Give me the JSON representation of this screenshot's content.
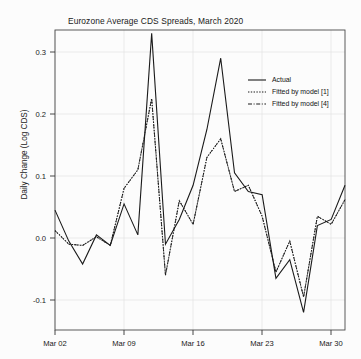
{
  "chart_data": {
    "type": "line",
    "title": "Eurozone Average CDS Spreads, March 2020",
    "xlabel": "",
    "ylabel": "Daily Change (Log CDS)",
    "ylim": [
      -0.16,
      0.345
    ],
    "xlim": [
      0,
      21
    ],
    "grid": true,
    "legend_position": "top-right",
    "yticks": [
      "0.3",
      "0.2",
      "0.1",
      "0.0",
      "-0.1"
    ],
    "ytick_values": [
      0.3,
      0.2,
      0.1,
      0.0,
      -0.1
    ],
    "xticks": [
      "Mar 02",
      "Mar 09",
      "Mar 16",
      "Mar 23",
      "Mar 30"
    ],
    "xtick_positions": [
      0,
      5,
      10,
      15,
      20
    ],
    "x": [
      0,
      1,
      2,
      3,
      4,
      5,
      6,
      7,
      8,
      9,
      10,
      11,
      12,
      13,
      14,
      15,
      16,
      17,
      18,
      19,
      20,
      21
    ],
    "series": [
      {
        "name": "Actual",
        "style": "solid",
        "color": "#1a1a1a",
        "values": [
          0.045,
          -0.005,
          -0.042,
          0.005,
          -0.012,
          0.055,
          0.005,
          0.33,
          -0.01,
          0.03,
          0.085,
          0.175,
          0.29,
          0.105,
          0.075,
          0.07,
          -0.065,
          -0.035,
          -0.12,
          0.02,
          0.03,
          0.085
        ]
      },
      {
        "name": "Fitted by model [1]",
        "style": "dotted",
        "color": "#1a1a1a",
        "values": [
          0.012,
          -0.01,
          -0.012,
          0.002,
          -0.012,
          0.08,
          0.11,
          0.225,
          -0.06,
          0.06,
          0.022,
          0.13,
          0.16,
          0.075,
          0.085,
          0.035,
          -0.055,
          -0.005,
          -0.095,
          0.035,
          0.022,
          0.062
        ]
      },
      {
        "name": "Fitted by model [4]",
        "style": "dashdot",
        "color": "#1a1a1a",
        "values": [
          0.012,
          -0.01,
          -0.012,
          0.002,
          -0.012,
          0.08,
          0.11,
          0.225,
          -0.06,
          0.06,
          0.022,
          0.13,
          0.16,
          0.075,
          0.085,
          0.035,
          -0.055,
          -0.005,
          -0.095,
          0.035,
          0.022,
          0.062
        ]
      }
    ]
  },
  "legend": {
    "entries": [
      {
        "label": "Actual"
      },
      {
        "label": "Fitted by model [1]"
      },
      {
        "label": "Fitted by model [4]"
      }
    ]
  }
}
